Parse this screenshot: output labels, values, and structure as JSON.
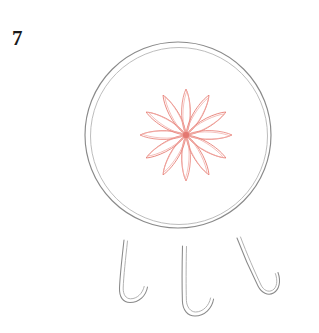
{
  "canvas": {
    "width": 319,
    "height": 333,
    "background": "#ffffff"
  },
  "label": {
    "text": "7",
    "color": "#1a1a1a",
    "x": 12,
    "y": 28
  },
  "figure": {
    "tabletop": {
      "shape": "circle",
      "center_x": 178,
      "center_y": 135,
      "radius": 93,
      "inner_radius": 89,
      "stroke": "#8a8a8a",
      "inner_stroke": "#b4b4b4",
      "stroke_width": 1.1,
      "fill": "none",
      "double_outline": true
    },
    "flower": {
      "name": "twelve-petal-rosette",
      "center_x": 186,
      "center_y": 135,
      "petal_count": 12,
      "petal_length": 46,
      "petal_half_width": 7.5,
      "stroke": "#e8847c",
      "stroke_light": "#f0a9a3",
      "core_color": "#e06c66",
      "stroke_width": 0.85,
      "fill": "none",
      "rotation_offset_deg": 0
    },
    "legs": {
      "count": 3,
      "stroke": "#8a8a8a",
      "stroke_width": 1.0,
      "fill": "none",
      "foot_style": "hook-curl-right",
      "items": [
        {
          "name": "left-leg",
          "top_x": 124,
          "top_y": 240,
          "foot_x": 120,
          "foot_y": 300,
          "curl_x": 147,
          "curl_y": 288
        },
        {
          "name": "center-leg",
          "top_x": 183,
          "top_y": 246,
          "foot_x": 186,
          "foot_y": 315,
          "curl_x": 214,
          "curl_y": 301
        },
        {
          "name": "right-leg",
          "top_x": 238,
          "top_y": 238,
          "foot_x": 259,
          "foot_y": 295,
          "curl_x": 277,
          "curl_y": 272
        }
      ]
    }
  }
}
